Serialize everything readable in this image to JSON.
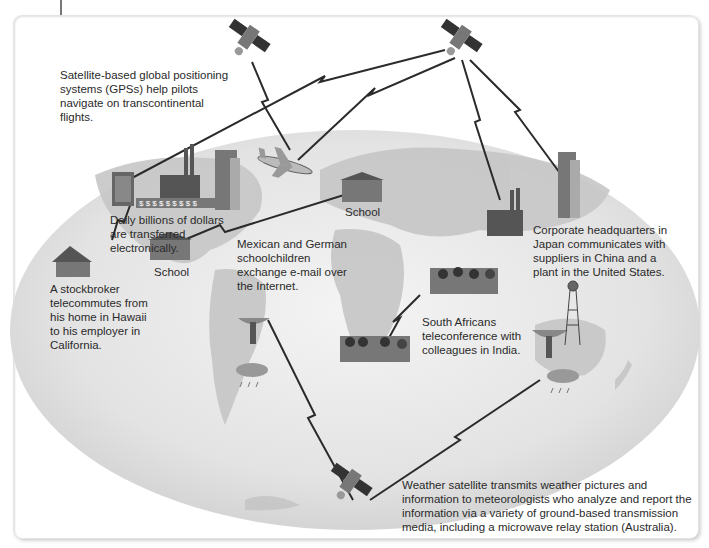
{
  "diagram": {
    "type": "telecommunications-applications-world-map",
    "captions": {
      "gps": "Satellite-based global positioning systems (GPSs) help pilots navigate on transcontinental flights.",
      "dollars": "Daily billions of dollars are transferred electronically.",
      "stockbroker": "A stockbroker telecommutes from his home in Hawaii to his employer in California.",
      "schoolchildren": "Mexican and German schoolchildren exchange e-mail over the Internet.",
      "corporate": "Corporate headquarters in Japan communicates with suppliers in China and a plant in the United States.",
      "south_africa": "South Africans teleconference with colleagues in India.",
      "weather": "Weather satellite transmits weather pictures and information to meteorologists who analyze and report the information via a variety of ground-based transmission media, including a microwave relay station (Australia)."
    },
    "labels": {
      "school_germany": "School",
      "school_mexico": "School",
      "dollar_strip": "$ $ $ $ $ $ $ $ $"
    },
    "nodes": [
      {
        "id": "satellite-gps",
        "icon": "satellite-icon"
      },
      {
        "id": "satellite-comm",
        "icon": "satellite-icon"
      },
      {
        "id": "satellite-weather",
        "icon": "satellite-icon"
      },
      {
        "id": "airplane",
        "icon": "airplane-icon"
      },
      {
        "id": "bank-building",
        "icon": "office-building-icon"
      },
      {
        "id": "factory-us",
        "icon": "factory-icon"
      },
      {
        "id": "skyscraper-us",
        "icon": "skyscraper-icon"
      },
      {
        "id": "home-hawaii",
        "icon": "house-icon"
      },
      {
        "id": "school-mexico",
        "icon": "school-icon"
      },
      {
        "id": "school-germany",
        "icon": "school-icon"
      },
      {
        "id": "factory-china",
        "icon": "factory-icon"
      },
      {
        "id": "hq-japan",
        "icon": "skyscraper-icon"
      },
      {
        "id": "meeting-india",
        "icon": "meeting-icon"
      },
      {
        "id": "meeting-south-africa",
        "icon": "meeting-icon"
      },
      {
        "id": "dish-south-america",
        "icon": "satellite-dish-icon"
      },
      {
        "id": "dish-australia",
        "icon": "satellite-dish-icon"
      },
      {
        "id": "microwave-tower",
        "icon": "microwave-tower-icon"
      },
      {
        "id": "rain-south-america",
        "icon": "rain-cloud-icon"
      },
      {
        "id": "rain-australia",
        "icon": "rain-cloud-icon"
      }
    ]
  }
}
